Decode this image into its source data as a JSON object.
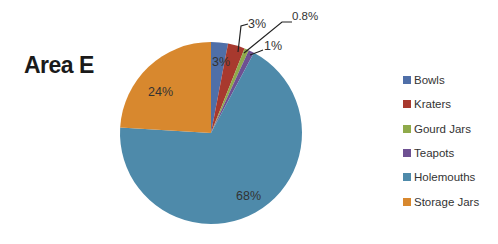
{
  "chart_data": {
    "type": "pie",
    "title": "Area E",
    "categories": [
      "Bowls",
      "Kraters",
      "Gourd Jars",
      "Teapots",
      "Holemouths",
      "Storage Jars"
    ],
    "values": [
      3,
      3,
      0.8,
      1,
      68,
      24
    ],
    "labels": [
      "3%",
      "3%",
      "0.8%",
      "1%",
      "68%",
      "24%"
    ],
    "colors": [
      "#4F6FA8",
      "#A8392E",
      "#8FAA4A",
      "#6E5092",
      "#4E8AAA",
      "#D8882E"
    ],
    "legend_position": "right",
    "start_angle": "12 o'clock, clockwise"
  },
  "title": "Area E",
  "legend": [
    {
      "label": "Bowls",
      "color": "#4F6FA8"
    },
    {
      "label": "Kraters",
      "color": "#A8392E"
    },
    {
      "label": "Gourd Jars",
      "color": "#8FAA4A"
    },
    {
      "label": "Teapots",
      "color": "#6E5092"
    },
    {
      "label": "Holemouths",
      "color": "#4E8AAA"
    },
    {
      "label": "Storage Jars",
      "color": "#D8882E"
    }
  ]
}
